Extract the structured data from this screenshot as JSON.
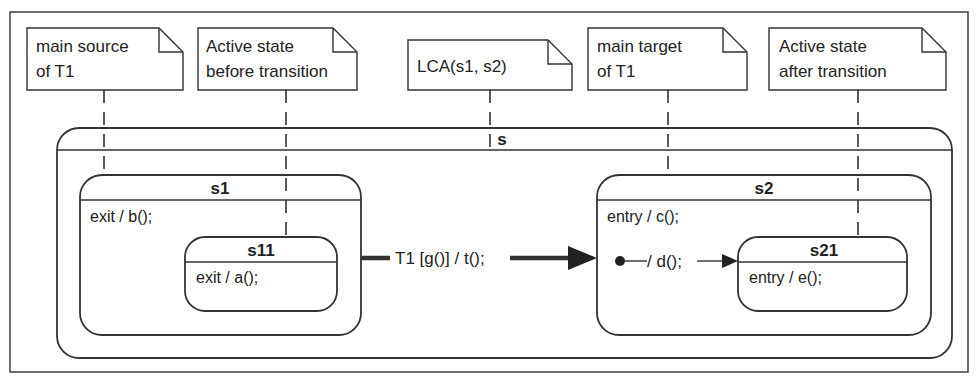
{
  "diagram": {
    "type": "UML state machine",
    "notes": [
      {
        "id": "main-source",
        "lines": [
          "main source",
          "of T1"
        ],
        "attached_to": "s1"
      },
      {
        "id": "active-before",
        "lines": [
          "Active state",
          "before transition"
        ],
        "attached_to": "s11"
      },
      {
        "id": "lca",
        "lines": [
          "LCA(s1, s2)"
        ],
        "attached_to": "s"
      },
      {
        "id": "main-target",
        "lines": [
          "main target",
          "of T1"
        ],
        "attached_to": "s2"
      },
      {
        "id": "active-after",
        "lines": [
          "Active state",
          "after transition"
        ],
        "attached_to": "s21"
      }
    ],
    "states": {
      "s": {
        "name": "s"
      },
      "s1": {
        "name": "s1",
        "action": "exit / b();"
      },
      "s11": {
        "name": "s11",
        "action": "exit / a();"
      },
      "s2": {
        "name": "s2",
        "action": "entry / c();"
      },
      "s21": {
        "name": "s21",
        "action": "entry / e();"
      }
    },
    "transitions": {
      "t1": {
        "label": "T1 [g()] / t();",
        "source": "s1",
        "target": "s2"
      },
      "initial": {
        "label": "/ d();",
        "source": "initial-pseudostate",
        "target": "s21"
      }
    }
  },
  "colors": {
    "stroke": "#333333",
    "text": "#222222",
    "background": "#ffffff"
  }
}
